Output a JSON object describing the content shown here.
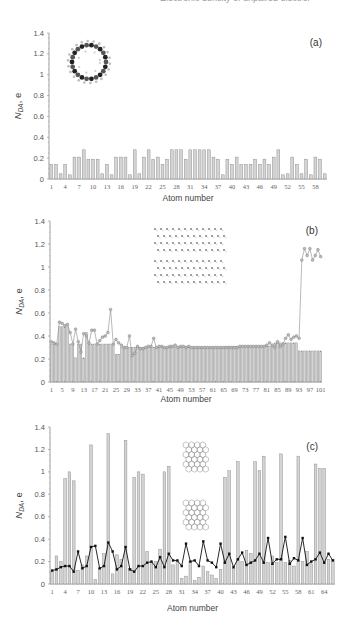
{
  "header": {
    "text": "Electronic density of unpaired electrons"
  },
  "chart_data": [
    {
      "type": "bar",
      "panel_label": "(a)",
      "title": "",
      "xlabel": "Atom number",
      "ylabel": "N_DA, e",
      "ylim": [
        0,
        1.4
      ],
      "yticks": [
        "0",
        "0.2",
        "0.4",
        "0.6",
        "0.8",
        "1",
        "1.2",
        "1.4"
      ],
      "xtick_labels": [
        "1",
        "4",
        "7",
        "10",
        "13",
        "16",
        "19",
        "22",
        "25",
        "28",
        "31",
        "34",
        "37",
        "40",
        "43",
        "46",
        "49",
        "52",
        "55",
        "58"
      ],
      "grid": false,
      "inset": "ring molecule (cycloarene)",
      "categories": [
        1,
        2,
        3,
        4,
        5,
        6,
        7,
        8,
        9,
        10,
        11,
        12,
        13,
        14,
        15,
        16,
        17,
        18,
        19,
        20,
        21,
        22,
        23,
        24,
        25,
        26,
        27,
        28,
        29,
        30,
        31,
        32,
        33,
        34,
        35,
        36,
        37,
        38,
        39,
        40,
        41,
        42,
        43,
        44,
        45,
        46,
        47,
        48,
        49,
        50,
        51,
        52,
        53,
        54,
        55,
        56,
        57,
        58,
        59,
        60
      ],
      "values": [
        0.14,
        0.14,
        0.05,
        0.14,
        0.04,
        0.21,
        0.21,
        0.28,
        0.19,
        0.19,
        0.19,
        0.05,
        0.14,
        0.04,
        0.21,
        0.21,
        0.21,
        0.04,
        0.28,
        0.05,
        0.21,
        0.28,
        0.19,
        0.21,
        0.14,
        0.19,
        0.28,
        0.28,
        0.28,
        0.19,
        0.28,
        0.28,
        0.28,
        0.28,
        0.28,
        0.21,
        0.19,
        0.04,
        0.19,
        0.14,
        0.21,
        0.14,
        0.14,
        0.14,
        0.19,
        0.14,
        0.19,
        0.14,
        0.21,
        0.28,
        0.04,
        0.05,
        0.21,
        0.14,
        0.05,
        0.19,
        0.04,
        0.21,
        0.19,
        0.05
      ]
    },
    {
      "type": "bar",
      "panel_label": "(b)",
      "title": "",
      "xlabel": "Atom number",
      "ylabel": "N_DA, e",
      "ylim": [
        0,
        1.4
      ],
      "yticks": [
        "0",
        "0.2",
        "0.4",
        "0.6",
        "0.8",
        "1",
        "1.2",
        "1.4"
      ],
      "xtick_labels": [
        "1",
        "5",
        "9",
        "13",
        "17",
        "21",
        "25",
        "29",
        "33",
        "37",
        "41",
        "45",
        "49",
        "53",
        "57",
        "61",
        "65",
        "69",
        "73",
        "77",
        "81",
        "85",
        "89",
        "93",
        "97",
        "101"
      ],
      "grid": false,
      "inset": "graphene sheet fragment",
      "categories_count": 101,
      "series": [
        {
          "name": "bars",
          "values": [
            0.33,
            0.33,
            0.33,
            0.48,
            0.48,
            0.48,
            0.48,
            0.33,
            0.33,
            0.21,
            0.33,
            0.33,
            0.21,
            0.43,
            0.33,
            0.33,
            0.33,
            0.33,
            0.33,
            0.33,
            0.33,
            0.33,
            0.33,
            0.33,
            0.24,
            0.24,
            0.3,
            0.3,
            0.3,
            0.3,
            0.3,
            0.3,
            0.3,
            0.3,
            0.3,
            0.3,
            0.3,
            0.3,
            0.3,
            0.3,
            0.3,
            0.3,
            0.3,
            0.3,
            0.3,
            0.3,
            0.3,
            0.3,
            0.3,
            0.3,
            0.3,
            0.3,
            0.3,
            0.3,
            0.3,
            0.3,
            0.3,
            0.3,
            0.3,
            0.3,
            0.3,
            0.3,
            0.3,
            0.3,
            0.3,
            0.31,
            0.31,
            0.31,
            0.31,
            0.31,
            0.31,
            0.31,
            0.31,
            0.31,
            0.31,
            0.31,
            0.31,
            0.31,
            0.31,
            0.31,
            0.31,
            0.31,
            0.31,
            0.34,
            0.34,
            0.34,
            0.34,
            0.34,
            0.34,
            0.34,
            0.34,
            0.34,
            0.27,
            0.27,
            0.27,
            0.27,
            0.27,
            0.27,
            0.27,
            0.27,
            0.27
          ]
        },
        {
          "name": "line",
          "values": [
            0.35,
            0.34,
            0.33,
            0.52,
            0.51,
            0.49,
            0.5,
            0.43,
            0.33,
            0.46,
            0.35,
            0.26,
            0.42,
            0.4,
            0.34,
            0.45,
            0.45,
            0.33,
            0.36,
            0.39,
            0.4,
            0.43,
            0.63,
            0.33,
            0.37,
            0.34,
            0.32,
            0.3,
            0.3,
            0.4,
            0.23,
            0.25,
            0.31,
            0.29,
            0.29,
            0.3,
            0.31,
            0.31,
            0.38,
            0.3,
            0.31,
            0.31,
            0.3,
            0.3,
            0.31,
            0.31,
            0.32,
            0.3,
            0.31,
            0.31,
            0.3,
            0.31,
            0.3,
            0.3,
            0.3,
            0.3,
            0.3,
            0.3,
            0.3,
            0.3,
            0.3,
            0.3,
            0.3,
            0.3,
            0.3,
            0.3,
            0.3,
            0.3,
            0.3,
            0.3,
            0.31,
            0.31,
            0.31,
            0.31,
            0.31,
            0.31,
            0.31,
            0.31,
            0.31,
            0.31,
            0.32,
            0.34,
            0.32,
            0.3,
            0.35,
            0.31,
            0.33,
            0.38,
            0.41,
            0.37,
            0.39,
            0.4,
            0.38,
            1.06,
            1.16,
            1.1,
            1.16,
            1.06,
            1.1,
            1.15,
            1.09
          ]
        }
      ]
    },
    {
      "type": "bar",
      "panel_label": "(c)",
      "title": "",
      "xlabel": "Atom number",
      "ylabel": "N_DA, e",
      "ylim": [
        0,
        1.4
      ],
      "yticks": [
        "0",
        "0.2",
        "0.4",
        "0.6",
        "0.8",
        "1",
        "1.2",
        "1.4"
      ],
      "xtick_labels": [
        "1",
        "4",
        "7",
        "10",
        "13",
        "16",
        "19",
        "22",
        "25",
        "28",
        "31",
        "34",
        "37",
        "40",
        "43",
        "46",
        "49",
        "52",
        "55",
        "58",
        "61",
        "64"
      ],
      "grid": false,
      "inset": "two graphene fragments (armchair/zigzag)",
      "categories_count": 66,
      "series": [
        {
          "name": "bars",
          "values": [
            0.11,
            0.25,
            0.2,
            0.94,
            1.0,
            0.92,
            0.12,
            0.17,
            0.25,
            1.24,
            0.04,
            0.14,
            0.27,
            1.34,
            0.09,
            0.26,
            0.22,
            1.28,
            0.14,
            0.95,
            1.0,
            0.98,
            0.29,
            0.19,
            0.2,
            0.31,
            1.0,
            1.05,
            0.17,
            0.2,
            0.05,
            0.07,
            0.2,
            0.03,
            0.06,
            0.16,
            0.11,
            0.08,
            0.05,
            0.13,
            0.95,
            1.01,
            0.14,
            1.09,
            0.2,
            0.3,
            0.27,
            1.09,
            1.01,
            1.14,
            0.19,
            0.25,
            0.19,
            1.16,
            0.19,
            0.21,
            0.16,
            1.14,
            0.2,
            0.29,
            0.18,
            1.07,
            1.03,
            1.03,
            0.22,
            0.22
          ]
        },
        {
          "name": "line",
          "values": [
            0.12,
            0.13,
            0.15,
            0.16,
            0.16,
            0.11,
            0.29,
            0.14,
            0.16,
            0.33,
            0.34,
            0.14,
            0.16,
            0.37,
            0.29,
            0.13,
            0.16,
            0.33,
            0.13,
            0.11,
            0.16,
            0.16,
            0.19,
            0.2,
            0.15,
            0.24,
            0.15,
            0.27,
            0.21,
            0.21,
            0.16,
            0.36,
            0.2,
            0.21,
            0.16,
            0.38,
            0.21,
            0.19,
            0.15,
            0.36,
            0.19,
            0.27,
            0.15,
            0.22,
            0.28,
            0.17,
            0.19,
            0.21,
            0.27,
            0.19,
            0.41,
            0.18,
            0.22,
            0.22,
            0.42,
            0.18,
            0.23,
            0.21,
            0.41,
            0.17,
            0.2,
            0.22,
            0.28,
            0.19,
            0.27,
            0.21
          ]
        }
      ]
    }
  ],
  "panels": {
    "a": {
      "label": "(a)",
      "xlabel": "Atom number",
      "ylabel_main": "N",
      "ylabel_sub": "DA",
      "ylabel_unit": ", e"
    },
    "b": {
      "label": "(b)",
      "xlabel": "Atom number",
      "ylabel_main": "N",
      "ylabel_sub": "DA",
      "ylabel_unit": ", e"
    },
    "c": {
      "label": "(c)",
      "xlabel": "Atom number",
      "ylabel_main": "N",
      "ylabel_sub": "DA",
      "ylabel_unit": ", e"
    }
  },
  "colors": {
    "bar_fill": "#d4d4d4",
    "bar_stroke": "#8a8a8a",
    "line_b": "#8a8a8a",
    "marker_b": "#bbbbbb",
    "line_c": "#111111",
    "axis": "#888888"
  }
}
